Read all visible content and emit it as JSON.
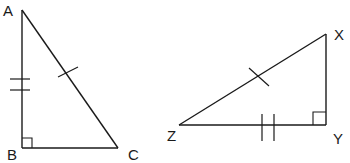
{
  "diagram": {
    "triangles": [
      {
        "name": "ABC",
        "vertices": [
          "A",
          "B",
          "C"
        ],
        "right_angle_at": "B",
        "tick_marks": {
          "AB": 2,
          "AC": 1
        }
      },
      {
        "name": "XYZ",
        "vertices": [
          "X",
          "Y",
          "Z"
        ],
        "right_angle_at": "Y",
        "tick_marks": {
          "ZY": 2,
          "ZX": 1
        }
      }
    ],
    "labels": {
      "A": "A",
      "B": "B",
      "C": "C",
      "X": "X",
      "Y": "Y",
      "Z": "Z"
    }
  }
}
